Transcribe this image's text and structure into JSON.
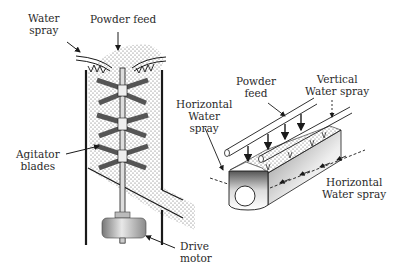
{
  "figure": {
    "left_apparatus": {
      "name": "Vertical agitated granulator",
      "labels": {
        "water_spray": [
          "Water",
          "spray"
        ],
        "powder_feed": "Powder feed",
        "agitator_blades": [
          "Agitator",
          "blades"
        ],
        "drive_motor": [
          "Drive",
          "motor"
        ]
      }
    },
    "right_apparatus": {
      "name": "Horizontal trough granulator",
      "labels": {
        "powder_feed": [
          "Powder",
          "feed"
        ],
        "vertical_water_spray": [
          "Vertical",
          "Water spray"
        ],
        "horizontal_water_spray_left": [
          "Horizontal",
          "Water",
          "spray"
        ],
        "horizontal_water_spray_right": [
          "Horizontal",
          "Water spray"
        ]
      }
    },
    "colors": {
      "line": "#1a1a1a",
      "blade": "#7a7a7a",
      "powder_dots": "#555555",
      "background": "#ffffff"
    }
  }
}
